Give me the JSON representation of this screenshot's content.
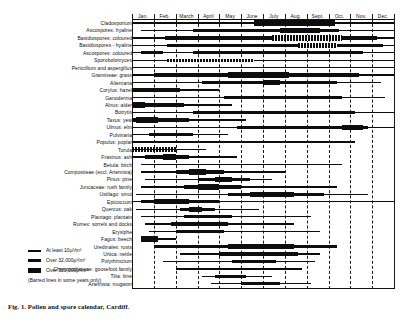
{
  "figure": {
    "caption": "Fig. 1. Pollen and spore calendar, Cardiff."
  },
  "chart_data": {
    "type": "bar",
    "title": "Pollen and spore calendar, Cardiff",
    "xlabel": "",
    "ylabel": "",
    "grid": true,
    "legend_position": "bottom-left",
    "x_axis": {
      "type": "months",
      "range_months": [
        1,
        12
      ],
      "tick_labels": [
        "Jan.",
        "Feb.",
        "March",
        "April",
        "May",
        "June",
        "July",
        "Aug.",
        "Sept.",
        "Oct.",
        "Nov.",
        "Dec."
      ]
    },
    "levels": {
      "1": "At least 10µ³/m³",
      "2": "Over 32,000µ³/m³",
      "3": "Over 320,000µ³/m³",
      "barred": "Barred lines: in some years only"
    },
    "categories": [
      "Cladosporium",
      "Ascospores: hyaline",
      "Basidiospores: coloured",
      "Basidiospores - hyaline",
      "Ascospores: coloured",
      "Sporobolomyces",
      "Penicillium and aspergillus",
      "Gramineae: grass",
      "Alternaria",
      "Corylus: hazel",
      "Ganoderma",
      "Alnus: alder",
      "Botrytis",
      "Taxus: yew",
      "Ulmus: elm",
      "Pulvinaria",
      "Populus: poplar",
      "Torula",
      "Fraxinus: ash",
      "Betula: birch",
      "Compositeae (excl. Artemisia)",
      "Pinus: pine",
      "Juncaceae: rush family",
      "Ustilago: smut",
      "Epicoccum",
      "Quercus: oak",
      "Plantago: plantain",
      "Rumex: sorrels and docks",
      "Erysiphe",
      "Fagus: beech",
      "Uredinales: rusts",
      "Urtica: nettle",
      "Polythrincium",
      "Chenopodiaceae: goosefoot family",
      "Tilia: lime",
      "Artemisia: mugwort"
    ],
    "series": [
      {
        "name": "Cladosporium",
        "segments": [
          {
            "start": 0.0,
            "end": 12.0,
            "level": 1
          },
          {
            "start": 5.6,
            "end": 9.3,
            "level": 3
          }
        ]
      },
      {
        "name": "Ascospores: hyaline",
        "segments": [
          {
            "start": 0.4,
            "end": 12.0,
            "level": 1
          },
          {
            "start": 2.8,
            "end": 9.5,
            "level": 2
          },
          {
            "start": 6.8,
            "end": 8.6,
            "level": 3
          }
        ]
      },
      {
        "name": "Basidiospores: coloured",
        "segments": [
          {
            "start": 0.0,
            "end": 12.0,
            "level": 1
          },
          {
            "start": 1.5,
            "end": 11.2,
            "level": 2
          },
          {
            "start": 6.4,
            "end": 9.6,
            "level": 3,
            "barred": true
          }
        ]
      },
      {
        "name": "Basidiospores - hyaline",
        "segments": [
          {
            "start": 0.0,
            "end": 12.0,
            "level": 1
          },
          {
            "start": 1.6,
            "end": 11.5,
            "level": 2
          },
          {
            "start": 7.6,
            "end": 9.4,
            "level": 3,
            "barred": true
          }
        ]
      },
      {
        "name": "Ascospores: coloured",
        "segments": [
          {
            "start": 0.0,
            "end": 12.0,
            "level": 1
          },
          {
            "start": 0.4,
            "end": 1.4,
            "level": 2
          },
          {
            "start": 2.8,
            "end": 10.6,
            "level": 2
          }
        ]
      },
      {
        "name": "Sporobolomyces",
        "segments": [
          {
            "start": 0.0,
            "end": 12.0,
            "level": 1
          },
          {
            "start": 1.6,
            "end": 5.6,
            "level": 2,
            "barred": true
          }
        ]
      },
      {
        "name": "Penicillium and aspergillus",
        "segments": [
          {
            "start": 0.0,
            "end": 12.0,
            "level": 1
          }
        ]
      },
      {
        "name": "Gramineae: grass",
        "segments": [
          {
            "start": 0.0,
            "end": 12.0,
            "level": 1
          },
          {
            "start": 1.0,
            "end": 10.4,
            "level": 2
          },
          {
            "start": 4.4,
            "end": 7.2,
            "level": 3
          }
        ]
      },
      {
        "name": "Alternaria",
        "segments": [
          {
            "start": 0.0,
            "end": 11.4,
            "level": 1
          },
          {
            "start": 3.2,
            "end": 9.4,
            "level": 2
          },
          {
            "start": 6.0,
            "end": 6.8,
            "level": 3
          }
        ]
      },
      {
        "name": "Corylus: hazel",
        "segments": [
          {
            "start": 0.0,
            "end": 4.0,
            "level": 1
          },
          {
            "start": 0.0,
            "end": 2.2,
            "level": 2
          }
        ]
      },
      {
        "name": "Ganoderma",
        "segments": [
          {
            "start": 0.0,
            "end": 11.6,
            "level": 1
          },
          {
            "start": 4.2,
            "end": 9.6,
            "level": 2
          }
        ]
      },
      {
        "name": "Alnus: alder",
        "segments": [
          {
            "start": 0.0,
            "end": 4.6,
            "level": 1
          },
          {
            "start": 0.0,
            "end": 2.4,
            "level": 2
          },
          {
            "start": 0.0,
            "end": 0.6,
            "level": 3
          }
        ]
      },
      {
        "name": "Botrytis",
        "segments": [
          {
            "start": 0.0,
            "end": 12.0,
            "level": 1
          },
          {
            "start": 2.8,
            "end": 10.2,
            "level": 2
          }
        ]
      },
      {
        "name": "Taxus: yew",
        "segments": [
          {
            "start": 0.0,
            "end": 5.2,
            "level": 1
          },
          {
            "start": 0.0,
            "end": 2.6,
            "level": 2
          },
          {
            "start": 0.2,
            "end": 1.2,
            "level": 3
          }
        ]
      },
      {
        "name": "Ulmus: elm",
        "segments": [
          {
            "start": 0.0,
            "end": 12.0,
            "level": 1
          },
          {
            "start": 4.8,
            "end": 10.8,
            "level": 2
          },
          {
            "start": 9.6,
            "end": 10.6,
            "level": 3
          }
        ]
      },
      {
        "name": "Pulvinaria",
        "segments": [
          {
            "start": 0.0,
            "end": 4.4,
            "level": 1
          },
          {
            "start": 0.8,
            "end": 2.8,
            "level": 2
          }
        ]
      },
      {
        "name": "Populus: poplar",
        "segments": [
          {
            "start": 0.0,
            "end": 10.2,
            "level": 1
          }
        ]
      },
      {
        "name": "Torula",
        "segments": [
          {
            "start": 0.0,
            "end": 2.0,
            "level": 3,
            "barred": true
          },
          {
            "start": 0.0,
            "end": 3.4,
            "level": 1
          }
        ]
      },
      {
        "name": "Fraxinus: ash",
        "segments": [
          {
            "start": 0.0,
            "end": 4.8,
            "level": 1
          },
          {
            "start": 0.6,
            "end": 2.6,
            "level": 2
          },
          {
            "start": 1.4,
            "end": 2.0,
            "level": 3
          }
        ]
      },
      {
        "name": "Betula: birch",
        "segments": [
          {
            "start": 0.4,
            "end": 9.6,
            "level": 1
          }
        ]
      },
      {
        "name": "Compositeae (excl. Artemisia)",
        "segments": [
          {
            "start": 0.4,
            "end": 7.0,
            "level": 1
          },
          {
            "start": 2.0,
            "end": 4.2,
            "level": 2
          },
          {
            "start": 2.6,
            "end": 3.4,
            "level": 3
          }
        ]
      },
      {
        "name": "Pinus: pine",
        "segments": [
          {
            "start": 0.6,
            "end": 6.4,
            "level": 1
          },
          {
            "start": 3.0,
            "end": 5.4,
            "level": 2
          },
          {
            "start": 3.8,
            "end": 4.6,
            "level": 3
          }
        ]
      },
      {
        "name": "Juncaceae: rush family",
        "segments": [
          {
            "start": 0.4,
            "end": 9.4,
            "level": 1
          },
          {
            "start": 2.4,
            "end": 5.0,
            "level": 2
          },
          {
            "start": 3.0,
            "end": 4.0,
            "level": 3
          }
        ]
      },
      {
        "name": "Ustilago: smut",
        "segments": [
          {
            "start": 0.2,
            "end": 10.8,
            "level": 1
          },
          {
            "start": 4.4,
            "end": 8.8,
            "level": 2
          },
          {
            "start": 5.4,
            "end": 7.4,
            "level": 3
          }
        ]
      },
      {
        "name": "Epicoccum",
        "segments": [
          {
            "start": 0.0,
            "end": 12.0,
            "level": 1
          },
          {
            "start": 0.4,
            "end": 4.0,
            "level": 2
          },
          {
            "start": 1.0,
            "end": 2.6,
            "level": 3
          }
        ]
      },
      {
        "name": "Quercus: oak",
        "segments": [
          {
            "start": 0.2,
            "end": 5.8,
            "level": 1
          },
          {
            "start": 2.2,
            "end": 3.8,
            "level": 2
          },
          {
            "start": 2.6,
            "end": 3.2,
            "level": 3
          }
        ]
      },
      {
        "name": "Plantago: plantain",
        "segments": [
          {
            "start": 0.4,
            "end": 8.2,
            "level": 1
          },
          {
            "start": 2.4,
            "end": 4.6,
            "level": 2
          }
        ]
      },
      {
        "name": "Rumex: sorrels and docks",
        "segments": [
          {
            "start": 0.6,
            "end": 7.4,
            "level": 1
          },
          {
            "start": 1.8,
            "end": 4.4,
            "level": 2
          }
        ]
      },
      {
        "name": "Erysiphe",
        "segments": [
          {
            "start": 0.8,
            "end": 8.6,
            "level": 1
          },
          {
            "start": 2.0,
            "end": 4.2,
            "level": 2
          }
        ]
      },
      {
        "name": "Fagus: beech",
        "segments": [
          {
            "start": 0.4,
            "end": 2.0,
            "level": 1
          },
          {
            "start": 0.4,
            "end": 1.2,
            "level": 3
          }
        ]
      },
      {
        "name": "Uredinales: rusts",
        "segments": [
          {
            "start": 1.0,
            "end": 9.4,
            "level": 2
          },
          {
            "start": 4.4,
            "end": 7.4,
            "level": 3
          }
        ]
      },
      {
        "name": "Urtica: nettle",
        "segments": [
          {
            "start": 2.2,
            "end": 8.6,
            "level": 1
          },
          {
            "start": 4.0,
            "end": 7.6,
            "level": 2
          }
        ]
      },
      {
        "name": "Polythrincium",
        "segments": [
          {
            "start": 1.4,
            "end": 8.4,
            "level": 1
          },
          {
            "start": 4.6,
            "end": 6.6,
            "level": 2
          }
        ]
      },
      {
        "name": "Chenopodiaceae: goosefoot family",
        "segments": [
          {
            "start": 2.0,
            "end": 7.8,
            "level": 1
          }
        ]
      },
      {
        "name": "Tilia: lime",
        "segments": [
          {
            "start": 3.2,
            "end": 6.4,
            "level": 1
          },
          {
            "start": 3.8,
            "end": 5.2,
            "level": 2
          }
        ]
      },
      {
        "name": "Artemisia: mugwort",
        "segments": [
          {
            "start": 3.6,
            "end": 8.2,
            "level": 1
          },
          {
            "start": 5.0,
            "end": 6.8,
            "level": 2
          }
        ]
      }
    ]
  },
  "legend": {
    "items": [
      {
        "level": 1,
        "label": "At least 10µ³/m³"
      },
      {
        "level": 2,
        "label": "Over 32,000µ³/m³"
      },
      {
        "level": 3,
        "label": "Over 320,000µ³/m³"
      }
    ],
    "note": "(Barred lines in some  years only)"
  }
}
